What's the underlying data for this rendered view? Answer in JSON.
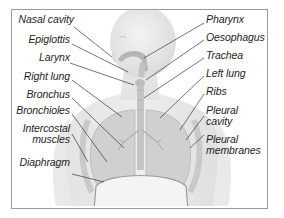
{
  "diagram": {
    "colors": {
      "frame": "#9a9a9a",
      "body": "#e6e6e6",
      "body_shadow": "#d2d2d2",
      "lungs": "#cfcfcf",
      "airway": "#b8b8b8",
      "leader": "#3a3a3a",
      "text": "#1e1e1e"
    },
    "labels_left": [
      {
        "id": "nasal-cavity",
        "text": "Nasal cavity"
      },
      {
        "id": "epiglottis",
        "text": "Epiglottis"
      },
      {
        "id": "larynx",
        "text": "Larynx"
      },
      {
        "id": "right-lung",
        "text": "Right lung"
      },
      {
        "id": "bronchus",
        "text": "Bronchus"
      },
      {
        "id": "bronchioles",
        "text": "Bronchioles"
      },
      {
        "id": "intercostal-muscles",
        "text_line1": "Intercostal",
        "text_line2": "muscles"
      },
      {
        "id": "diaphragm",
        "text": "Diaphragm"
      }
    ],
    "labels_right": [
      {
        "id": "pharynx",
        "text": "Pharynx"
      },
      {
        "id": "oesophagus",
        "text": "Oesophagus"
      },
      {
        "id": "trachea",
        "text": "Trachea"
      },
      {
        "id": "left-lung",
        "text": "Left lung"
      },
      {
        "id": "ribs",
        "text": "Ribs"
      },
      {
        "id": "pleural-cavity",
        "text_line1": "Pleural",
        "text_line2": "cavity"
      },
      {
        "id": "pleural-membranes",
        "text_line1": "Pleural",
        "text_line2": "membranes"
      }
    ]
  }
}
